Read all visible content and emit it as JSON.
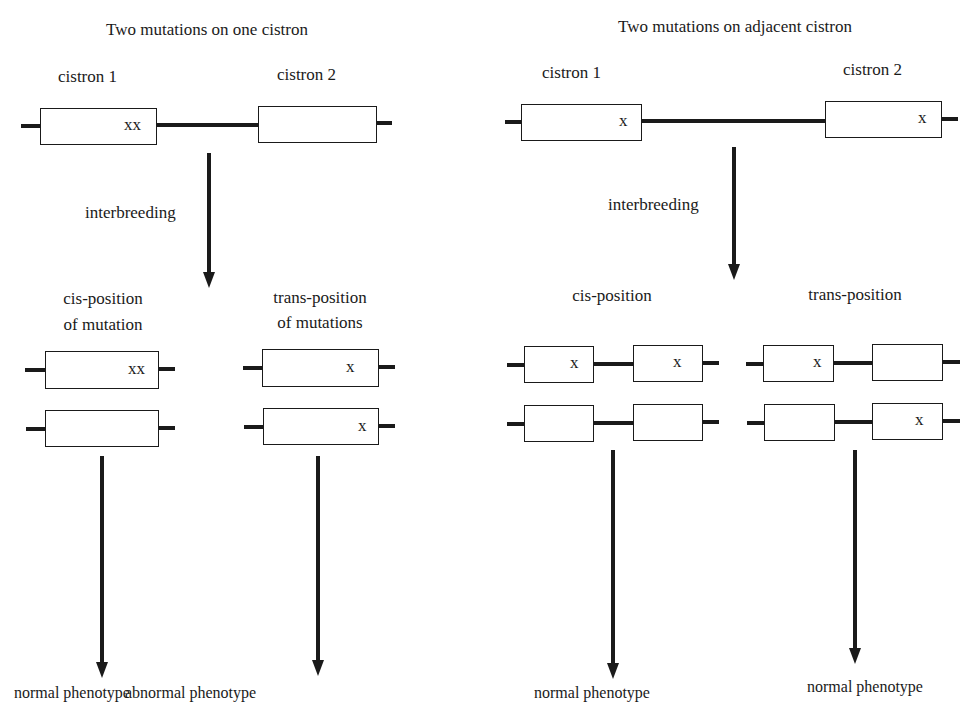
{
  "left_panel": {
    "title": "Two mutations on one cistron",
    "cistron_1_label": "cistron 1",
    "cistron_2_label": "cistron 2",
    "top_mark": "xx",
    "step_label": "interbreeding",
    "cis": {
      "label_line1": "cis-position",
      "label_line2": "of mutation",
      "strand_1_mark": "xx",
      "strand_2_mark": "",
      "result": "normal phenotype"
    },
    "trans": {
      "label_line1": "trans-position",
      "label_line2": "of mutations",
      "strand_1_mark": "x",
      "strand_2_mark": "x",
      "result": "abnormal phenotype"
    }
  },
  "right_panel": {
    "title": "Two mutations on adjacent cistron",
    "cistron_1_label": "cistron 1",
    "cistron_2_label": "cistron 2",
    "top_mark_1": "x",
    "top_mark_2": "x",
    "step_label": "interbreeding",
    "cis": {
      "label": "cis-position",
      "strand_1_marks": [
        "x",
        "x"
      ],
      "strand_2_marks": [
        "",
        ""
      ],
      "result": "normal phenotype"
    },
    "trans": {
      "label": "trans-position",
      "strand_1_marks": [
        "x",
        ""
      ],
      "strand_2_marks": [
        "",
        "x"
      ],
      "result": "normal phenotype"
    }
  }
}
